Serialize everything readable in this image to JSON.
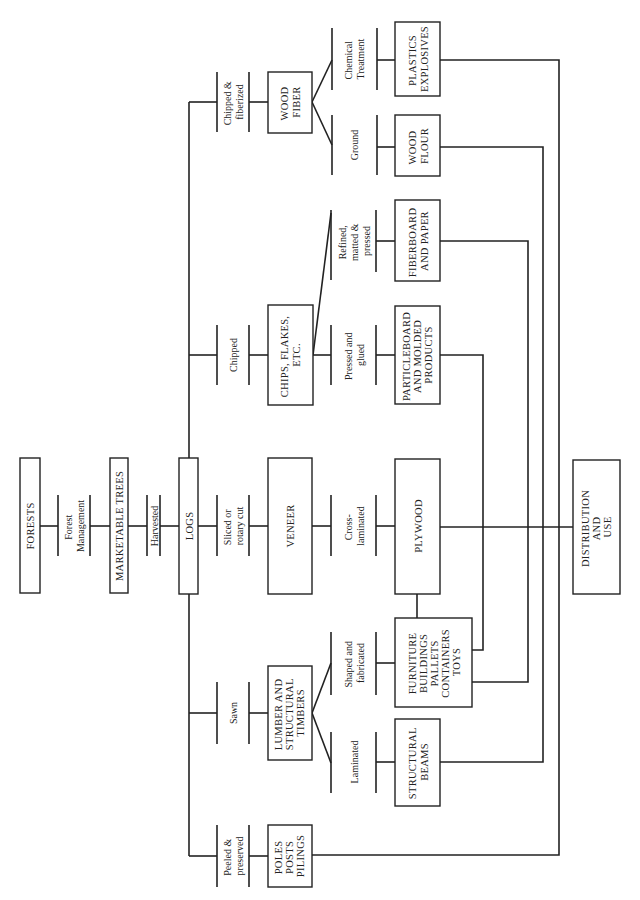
{
  "diagram": {
    "nodes": {
      "forests": {
        "lines": [
          "FORESTS"
        ]
      },
      "marketable_trees": {
        "lines": [
          "MARKETABLE TREES"
        ]
      },
      "logs": {
        "lines": [
          "LOGS"
        ]
      },
      "veneer": {
        "lines": [
          "VENEER"
        ]
      },
      "chips": {
        "lines": [
          "CHIPS, FLAKES,",
          "ETC."
        ]
      },
      "wood_fiber": {
        "lines": [
          "WOOD",
          "FIBER"
        ]
      },
      "lumber": {
        "lines": [
          "LUMBER AND",
          "STRUCTURAL",
          "TIMBERS"
        ]
      },
      "poles": {
        "lines": [
          "POLES",
          "POSTS",
          "PILINGS"
        ]
      },
      "plastics": {
        "lines": [
          "PLASTICS",
          "EXPLOSIVES"
        ]
      },
      "wood_flour": {
        "lines": [
          "WOOD",
          "FLOUR"
        ]
      },
      "fiberboard": {
        "lines": [
          "FIBERBOARD",
          "AND PAPER"
        ]
      },
      "particleboard": {
        "lines": [
          "PARTICLEBOARD",
          "AND MOLDED",
          "PRODUCTS"
        ]
      },
      "plywood": {
        "lines": [
          "PLYWOOD"
        ]
      },
      "furniture": {
        "lines": [
          "FURNITURE",
          "BUILDINGS",
          "PALLETS",
          "CONTAINERS",
          "TOYS"
        ]
      },
      "structural_beams": {
        "lines": [
          "STRUCTURAL",
          "BEAMS"
        ]
      },
      "distribution": {
        "lines": [
          "DISTRIBUTION",
          "AND",
          "USE"
        ]
      }
    },
    "processes": {
      "forest_management": {
        "lines": [
          "Forest",
          "Management"
        ]
      },
      "harvested": {
        "lines": [
          "Harvested"
        ]
      },
      "chipped_fiberized": {
        "lines": [
          "Chipped &",
          "fiberized"
        ]
      },
      "chipped": {
        "lines": [
          "Chipped"
        ]
      },
      "sliced": {
        "lines": [
          "Sliced or",
          "rotary cut"
        ]
      },
      "sawn": {
        "lines": [
          "Sawn"
        ]
      },
      "peeled": {
        "lines": [
          "Peeled &",
          "preserved"
        ]
      },
      "chemical": {
        "lines": [
          "Chemical",
          "Treatment"
        ]
      },
      "ground": {
        "lines": [
          "Ground"
        ]
      },
      "refined": {
        "lines": [
          "Refined,",
          "matted &",
          "pressed"
        ]
      },
      "pressed": {
        "lines": [
          "Pressed and",
          "glued"
        ]
      },
      "cross_laminated": {
        "lines": [
          "Cross-",
          "laminated"
        ]
      },
      "shaped": {
        "lines": [
          "Shaped and",
          "fabricated"
        ]
      },
      "laminated": {
        "lines": [
          "Laminated"
        ]
      }
    }
  }
}
